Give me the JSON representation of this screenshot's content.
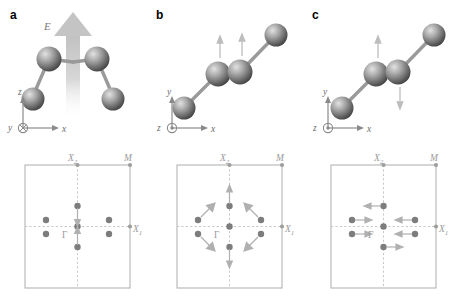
{
  "figure": {
    "panels": [
      {
        "label": "a",
        "field_label": "E",
        "axes": {
          "up": "z",
          "right": "x",
          "normal": "y",
          "normal_glyph": "cross-in-circle",
          "normal_meaning": "into-page"
        },
        "mode": "uniform-field-excitation",
        "bz": {
          "points": {
            "gamma": "Γ",
            "x1": "X",
            "x1_sub": "1",
            "x2": "X",
            "x2_sub": "2",
            "m": "M"
          },
          "arrows": "vertical-inward",
          "center_dot": true,
          "satellite_dots": 4
        }
      },
      {
        "label": "b",
        "axes": {
          "up": "y",
          "right": "x",
          "normal": "z",
          "normal_glyph": "dot-in-circle",
          "normal_meaning": "out-of-page"
        },
        "mode": "in-phase-transverse",
        "bz": {
          "points": {
            "gamma": "Γ",
            "x1": "X",
            "x1_sub": "1",
            "x2": "X",
            "x2_sub": "2",
            "m": "M"
          },
          "arrows": "radial-outward",
          "center_dot": true,
          "satellite_dots": 4
        }
      },
      {
        "label": "c",
        "axes": {
          "up": "y",
          "right": "x",
          "normal": "z",
          "normal_glyph": "dot-in-circle",
          "normal_meaning": "out-of-page"
        },
        "mode": "antiphase-transverse",
        "bz": {
          "points": {
            "gamma": "Γ",
            "x1": "X",
            "x1_sub": "1",
            "x2": "X",
            "x2_sub": "2",
            "m": "M"
          },
          "arrows": "horizontal-antiparallel",
          "center_dot": true,
          "satellite_dots": 4
        }
      }
    ],
    "colors": {
      "atom": "#8c8c8c",
      "atom_highlight": "#d6d6d6",
      "atom_shadow": "#4a4a4a",
      "bond": "#9a9a9a",
      "bz_line": "#b4b4b4",
      "bz_dash": "#c8c8c8",
      "bz_dot": "#8e8e8e",
      "label_gray": "#9a9a9a",
      "arrow_gray": "#b0b0b0",
      "field_arrow": "#c2c2c2"
    },
    "caption_fragment": ""
  }
}
